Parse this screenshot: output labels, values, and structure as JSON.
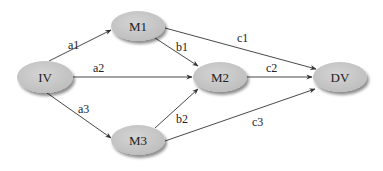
{
  "diagram": {
    "type": "mediation-path-diagram",
    "colors": {
      "node_fill": "#c8c8c8",
      "node_shadow": "#9a9a9a",
      "edge": "#333333",
      "text": "#222222",
      "background": "#ffffff"
    },
    "nodes": [
      {
        "id": "IV",
        "label": "IV",
        "cx": 45,
        "cy": 77,
        "rx": 28,
        "ry": 16
      },
      {
        "id": "M1",
        "label": "M1",
        "cx": 138,
        "cy": 26,
        "rx": 27,
        "ry": 15
      },
      {
        "id": "M2",
        "label": "M2",
        "cx": 220,
        "cy": 77,
        "rx": 27,
        "ry": 15
      },
      {
        "id": "M3",
        "label": "M3",
        "cx": 138,
        "cy": 140,
        "rx": 27,
        "ry": 15
      },
      {
        "id": "DV",
        "label": "DV",
        "cx": 340,
        "cy": 77,
        "rx": 27,
        "ry": 15
      }
    ],
    "edges": [
      {
        "from": "IV",
        "to": "M1",
        "label": "a1",
        "x1": 49,
        "y1": 61,
        "x2": 111,
        "y2": 30,
        "lx": 68,
        "ly": 49
      },
      {
        "from": "IV",
        "to": "M2",
        "label": "a2",
        "x1": 73,
        "y1": 77,
        "x2": 192,
        "y2": 77,
        "lx": 93,
        "ly": 72
      },
      {
        "from": "IV",
        "to": "M3",
        "label": "a3",
        "x1": 47,
        "y1": 93,
        "x2": 111,
        "y2": 138,
        "lx": 78,
        "ly": 113
      },
      {
        "from": "M1",
        "to": "M2",
        "label": "b1",
        "x1": 155,
        "y1": 38,
        "x2": 198,
        "y2": 66,
        "lx": 176,
        "ly": 51
      },
      {
        "from": "M3",
        "to": "M2",
        "label": "b2",
        "x1": 155,
        "y1": 128,
        "x2": 198,
        "y2": 89,
        "lx": 176,
        "ly": 123
      },
      {
        "from": "M1",
        "to": "DV",
        "label": "c1",
        "x1": 165,
        "y1": 28,
        "x2": 316,
        "y2": 69,
        "lx": 237,
        "ly": 42
      },
      {
        "from": "M2",
        "to": "DV",
        "label": "c2",
        "x1": 237,
        "y1": 77,
        "x2": 312,
        "y2": 77,
        "lx": 266,
        "ly": 72
      },
      {
        "from": "M3",
        "to": "DV",
        "label": "c3",
        "x1": 165,
        "y1": 141,
        "x2": 315,
        "y2": 89,
        "lx": 252,
        "ly": 126
      }
    ]
  }
}
